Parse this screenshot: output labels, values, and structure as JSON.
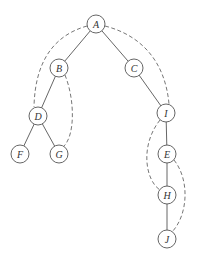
{
  "diagram": {
    "type": "tree",
    "node_radius": 9,
    "nodes": [
      {
        "id": "A",
        "label": "A",
        "x": 96,
        "y": 24
      },
      {
        "id": "B",
        "label": "B",
        "x": 59,
        "y": 68
      },
      {
        "id": "C",
        "label": "C",
        "x": 134,
        "y": 68
      },
      {
        "id": "D",
        "label": "D",
        "x": 38,
        "y": 116
      },
      {
        "id": "I",
        "label": "I",
        "x": 166,
        "y": 113
      },
      {
        "id": "F",
        "label": "F",
        "x": 20,
        "y": 154
      },
      {
        "id": "G",
        "label": "G",
        "x": 59,
        "y": 154
      },
      {
        "id": "E",
        "label": "E",
        "x": 167,
        "y": 154
      },
      {
        "id": "H",
        "label": "H",
        "x": 167,
        "y": 195
      },
      {
        "id": "J",
        "label": "J",
        "x": 167,
        "y": 239
      }
    ],
    "tree_edges": [
      {
        "from": "A",
        "to": "B"
      },
      {
        "from": "A",
        "to": "C"
      },
      {
        "from": "B",
        "to": "D"
      },
      {
        "from": "C",
        "to": "I"
      },
      {
        "from": "D",
        "to": "F"
      },
      {
        "from": "D",
        "to": "G"
      },
      {
        "from": "I",
        "to": "E"
      },
      {
        "from": "E",
        "to": "H"
      },
      {
        "from": "H",
        "to": "J"
      }
    ],
    "dashed_arcs": [
      {
        "from": "A",
        "to": "D",
        "path": "M 87 26 C 55 35, 35 60, 34 107"
      },
      {
        "from": "A",
        "to": "I",
        "path": "M 105 26 C 140 35, 165 60, 169 104"
      },
      {
        "from": "B",
        "to": "G",
        "path": "M 65 75 C 75 100, 75 135, 64 146"
      },
      {
        "from": "I",
        "to": "H",
        "path": "M 160 120 C 140 145, 145 180, 160 190"
      },
      {
        "from": "E",
        "to": "J",
        "path": "M 174 160 C 190 180, 188 215, 172 232"
      }
    ]
  }
}
